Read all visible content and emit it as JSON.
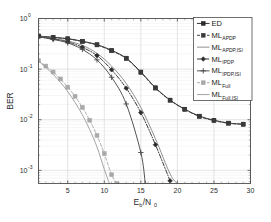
{
  "figure": {
    "background": "#ffffff",
    "frame_color": "#4d4d4d"
  },
  "axis": {
    "xlabel_main": "E",
    "xlabel_sub1": "b",
    "xlabel_slash": "/N",
    "xlabel_sub2": "0",
    "ylabel": "BER",
    "x_ticks": [
      "5",
      "10",
      "15",
      "20",
      "25",
      "30"
    ],
    "x_tick_values": [
      5,
      10,
      15,
      20,
      25,
      30
    ],
    "y_ticks": [
      "10",
      "10",
      "10",
      "10"
    ],
    "y_tick_exponents": [
      "0",
      "-1",
      "-2",
      "-3"
    ]
  },
  "legend": {
    "entries": [
      {
        "label": "ED",
        "sub": "",
        "color": "#2b2b2b",
        "dash": "none",
        "marker": "square"
      },
      {
        "label": "ML",
        "sub": "APDP",
        "color": "#3a3a3a",
        "dash": "dashed",
        "marker": "square"
      },
      {
        "label": "ML",
        "sub": "APDP,ISI",
        "color": "#8a8a8a",
        "dash": "none",
        "marker": "none"
      },
      {
        "label": "ML",
        "sub": "IPDP",
        "color": "#2b2b2b",
        "dash": "dashdot",
        "marker": "diamond"
      },
      {
        "label": "ML",
        "sub": "IPDP,ISI",
        "color": "#4a4a4a",
        "dash": "none",
        "marker": "plus"
      },
      {
        "label": "ML",
        "sub": "Full",
        "color": "#a8a8a8",
        "dash": "dashed",
        "marker": "square"
      },
      {
        "label": "ML",
        "sub": "Full,ISI",
        "color": "#9e9e9e",
        "dash": "none",
        "marker": "none"
      }
    ]
  },
  "chart_data": {
    "type": "line",
    "title": "",
    "xlabel": "Eb/N0",
    "ylabel": "BER",
    "xlim": [
      1,
      30
    ],
    "ylim": [
      0.00055,
      1.0
    ],
    "yscale": "log",
    "grid": true,
    "legend_position": "top-right",
    "series": [
      {
        "name": "ED",
        "color": "#2b2b2b",
        "dash": "none",
        "marker": "square",
        "x": [
          1,
          3,
          5,
          7,
          9,
          11,
          13,
          15,
          17,
          19,
          21,
          23,
          25,
          27,
          29
        ],
        "y": [
          0.45,
          0.425,
          0.4,
          0.355,
          0.305,
          0.235,
          0.165,
          0.088,
          0.043,
          0.0245,
          0.0162,
          0.0118,
          0.0098,
          0.0086,
          0.0082
        ]
      },
      {
        "name": "ML_APDP",
        "color": "#3a3a3a",
        "dash": "dashed",
        "marker": "square",
        "x": [
          1,
          3,
          5,
          7,
          9,
          11,
          13,
          15,
          17,
          19,
          21,
          23,
          25,
          27,
          29
        ],
        "y": [
          0.45,
          0.42,
          0.395,
          0.35,
          0.3,
          0.23,
          0.162,
          0.086,
          0.042,
          0.0242,
          0.016,
          0.0116,
          0.0096,
          0.0085,
          0.0081
        ]
      },
      {
        "name": "ML_APDP,ISI",
        "color": "#8a8a8a",
        "dash": "none",
        "marker": "none",
        "x": [
          1,
          3,
          5,
          7,
          9,
          11,
          13,
          15,
          17,
          19,
          20
        ],
        "y": [
          0.44,
          0.405,
          0.36,
          0.295,
          0.205,
          0.115,
          0.052,
          0.0175,
          0.0042,
          0.00085,
          0.00055
        ]
      },
      {
        "name": "ML_IPDP",
        "color": "#2b2b2b",
        "dash": "dashdot",
        "marker": "diamond",
        "x": [
          1,
          3,
          5,
          7,
          9,
          11,
          13,
          15,
          17,
          19
        ],
        "y": [
          0.44,
          0.395,
          0.345,
          0.27,
          0.185,
          0.097,
          0.042,
          0.0138,
          0.0032,
          0.00062
        ]
      },
      {
        "name": "ML_IPDP,ISI",
        "color": "#4a4a4a",
        "dash": "none",
        "marker": "plus",
        "x": [
          1,
          3,
          5,
          7,
          9,
          11,
          13,
          15,
          15.6
        ],
        "y": [
          0.435,
          0.385,
          0.33,
          0.245,
          0.152,
          0.069,
          0.0205,
          0.00225,
          0.00055
        ]
      },
      {
        "name": "ML_Full",
        "color": "#a8a8a8",
        "dash": "dashed",
        "marker": "square",
        "x": [
          1,
          2,
          3,
          4,
          5,
          6,
          7,
          8,
          9,
          10,
          11,
          11.7
        ],
        "y": [
          0.147,
          0.115,
          0.088,
          0.064,
          0.044,
          0.029,
          0.0175,
          0.0098,
          0.0049,
          0.00215,
          0.00082,
          0.00055
        ]
      },
      {
        "name": "ML_Full,ISI",
        "color": "#9e9e9e",
        "dash": "none",
        "marker": "none",
        "x": [
          1,
          2,
          3,
          4,
          5,
          6,
          7,
          8,
          9,
          10,
          10.7
        ],
        "y": [
          0.145,
          0.108,
          0.079,
          0.055,
          0.036,
          0.022,
          0.0125,
          0.0064,
          0.0029,
          0.00105,
          0.00055
        ]
      }
    ]
  }
}
